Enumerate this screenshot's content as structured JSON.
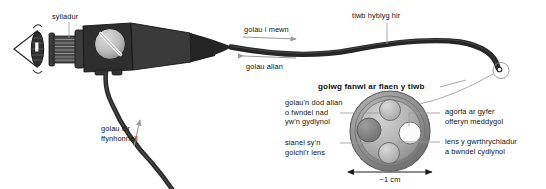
{
  "figure": {
    "background_color": "#ffffff",
    "text_color": "#111111",
    "leader_line_color": "#9a9a9a",
    "body_dark_color": "#2b2b2b",
    "metal_light_color": "#c9c9c9",
    "scale_note": "~1 cm"
  },
  "labels": {
    "eyepiece": "sylladur",
    "light_in": "golau i mewn",
    "light_out": "golau allan",
    "long_flexible_tube": "tiwb hyblyg hir",
    "light_from_source": "golau o'r\nffynhonnell",
    "detail_title": "golwg fanwl ar flaen y tiwb",
    "incoherent_bundle": "golau'n dod allan\no fwndel nad\nyw'n gydlynol",
    "lens_wash_channel": "sianel sy'n\ngolchi'r lens",
    "instrument_port": "agorfa ar gyfer\nofferyn meddygol",
    "objective_lens": "lens y gwrthrychiadur\na bwndel cydlynol",
    "scale_bar": "~1 cm"
  },
  "icons": {
    "eye": "eye-icon",
    "control_knob": "control-knob-icon",
    "arrow_right": "arrow-right-icon",
    "arrow_left": "arrow-left-icon",
    "arrow_up": "arrow-up-icon",
    "scale_arrow": "double-arrow-icon",
    "tip_marker": "tube-tip-circle-icon"
  },
  "cross_section": {
    "outer_ring_color": "#8e8e8e",
    "inner_disc_color": "#b9b9b9",
    "channels": [
      {
        "name": "incoherent-light-bundle",
        "fill": "#b5b5b5",
        "position": "top"
      },
      {
        "name": "instrument-port",
        "fill": "#fbfbfb",
        "position": "right"
      },
      {
        "name": "objective-lens-coherent-bundle",
        "fill": "#bdbdbd",
        "position": "bottom"
      },
      {
        "name": "lens-wash-channel",
        "fill": "#8f8f8f",
        "position": "left"
      }
    ]
  }
}
